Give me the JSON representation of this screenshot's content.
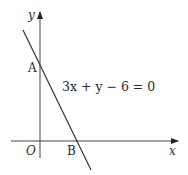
{
  "diagram": {
    "type": "coordinate-plane",
    "axes": {
      "x_label": "x",
      "y_label": "y",
      "origin_label": "O"
    },
    "line": {
      "equation": "3x + y − 6 = 0",
      "points": [
        {
          "label": "A",
          "description": "y-intercept"
        },
        {
          "label": "B",
          "description": "x-intercept"
        }
      ]
    },
    "colors": {
      "stroke": "#333333",
      "text": "#2a2a2a",
      "background": "#ffffff"
    }
  }
}
